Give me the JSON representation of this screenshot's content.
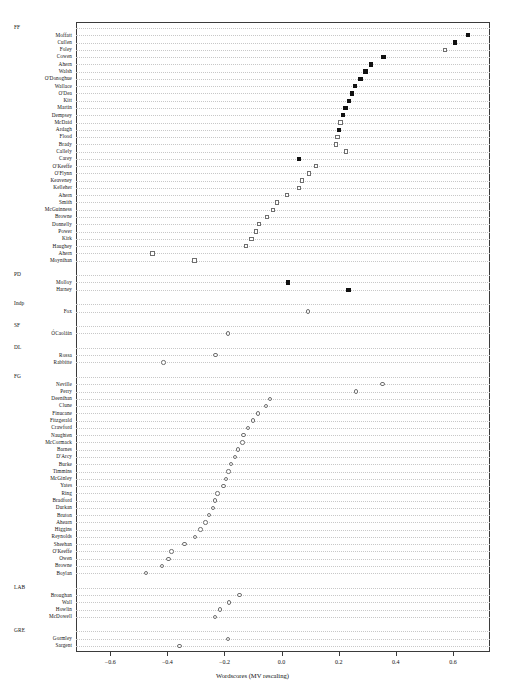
{
  "chart_data": {
    "type": "scatter",
    "title": "",
    "xlabel": "Wordscores (MV rescaling)",
    "ylabel": "",
    "xlim": [
      -0.72,
      0.73
    ],
    "grid": true,
    "legend": "none",
    "xticks": [
      -0.6,
      -0.4,
      -0.2,
      0.0,
      0.2,
      0.4,
      0.6
    ],
    "xticklabels": [
      "-0.6",
      "-0.4",
      "-0.2",
      "0.0",
      "0.2",
      "0.4",
      "0.6"
    ],
    "groups": [
      {
        "name": "FF",
        "marker": "square",
        "points": [
          {
            "label": "Moffatt",
            "value": 0.654,
            "fill": "filled"
          },
          {
            "label": "Cullen",
            "value": 0.608,
            "fill": "filled"
          },
          {
            "label": "Foley",
            "value": 0.573,
            "fill": "open"
          },
          {
            "label": "Cowen",
            "value": 0.357,
            "fill": "filled"
          },
          {
            "label": "Ahern",
            "value": 0.313,
            "fill": "filled"
          },
          {
            "label": "Walsh",
            "value": 0.294,
            "fill": "filled"
          },
          {
            "label": "O'Donoghue",
            "value": 0.276,
            "fill": "filled"
          },
          {
            "label": "Wallace",
            "value": 0.258,
            "fill": "filled"
          },
          {
            "label": "O'Dea",
            "value": 0.247,
            "fill": "filled"
          },
          {
            "label": "Kitt",
            "value": 0.236,
            "fill": "filled"
          },
          {
            "label": "Martin",
            "value": 0.224,
            "fill": "filled"
          },
          {
            "label": "Dempsey",
            "value": 0.215,
            "fill": "filled"
          },
          {
            "label": "McDaid",
            "value": 0.207,
            "fill": "open"
          },
          {
            "label": "Ardagh",
            "value": 0.201,
            "fill": "filled"
          },
          {
            "label": "Flood",
            "value": 0.196,
            "fill": "open"
          },
          {
            "label": "Brady",
            "value": 0.191,
            "fill": "open"
          },
          {
            "label": "Callely",
            "value": 0.225,
            "fill": "open"
          },
          {
            "label": "Carey",
            "value": 0.06,
            "fill": "filled"
          },
          {
            "label": "O'Keeffe",
            "value": 0.121,
            "fill": "open"
          },
          {
            "label": "O'Flynn",
            "value": 0.097,
            "fill": "open"
          },
          {
            "label": "Keaveney",
            "value": 0.072,
            "fill": "open"
          },
          {
            "label": "Kelleher",
            "value": 0.062,
            "fill": "open"
          },
          {
            "label": "Ahern",
            "value": 0.018,
            "fill": "open"
          },
          {
            "label": "Smith",
            "value": -0.015,
            "fill": "open"
          },
          {
            "label": "McGuinness",
            "value": -0.031,
            "fill": "open"
          },
          {
            "label": "Browne",
            "value": -0.052,
            "fill": "open"
          },
          {
            "label": "Donnelly",
            "value": -0.08,
            "fill": "open"
          },
          {
            "label": "Power",
            "value": -0.089,
            "fill": "open"
          },
          {
            "label": "Kirk",
            "value": -0.105,
            "fill": "open"
          },
          {
            "label": "Haughey",
            "value": -0.125,
            "fill": "open"
          },
          {
            "label": "Ahern",
            "value": -0.452,
            "fill": "open"
          },
          {
            "label": "Moynihan",
            "value": -0.305,
            "fill": "open"
          }
        ]
      },
      {
        "name": "PD",
        "marker": "square",
        "points": [
          {
            "label": "Molloy",
            "value": 0.022,
            "fill": "filled"
          },
          {
            "label": "Harney",
            "value": 0.235,
            "fill": "filled"
          }
        ]
      },
      {
        "name": "Indp",
        "marker": "circle",
        "points": [
          {
            "label": "Fox",
            "value": 0.092,
            "fill": "open"
          }
        ]
      },
      {
        "name": "SF",
        "marker": "circle",
        "points": [
          {
            "label": "ÓCaoláin",
            "value": -0.188,
            "fill": "open"
          }
        ]
      },
      {
        "name": "DL",
        "marker": "circle",
        "points": [
          {
            "label": "Rossa",
            "value": -0.232,
            "fill": "open"
          },
          {
            "label": "Rabbitte",
            "value": -0.413,
            "fill": "open"
          }
        ]
      },
      {
        "name": "FG",
        "marker": "circle",
        "points": [
          {
            "label": "Neville",
            "value": 0.354,
            "fill": "open"
          },
          {
            "label": "Perry",
            "value": 0.26,
            "fill": "open"
          },
          {
            "label": "Deenihan",
            "value": -0.04,
            "fill": "open"
          },
          {
            "label": "Clune",
            "value": -0.055,
            "fill": "open"
          },
          {
            "label": "Finucane",
            "value": -0.082,
            "fill": "open"
          },
          {
            "label": "Fitzgerald",
            "value": -0.1,
            "fill": "open"
          },
          {
            "label": "Crawford",
            "value": -0.117,
            "fill": "open"
          },
          {
            "label": "Naughten",
            "value": -0.133,
            "fill": "open"
          },
          {
            "label": "McCormack",
            "value": -0.137,
            "fill": "open"
          },
          {
            "label": "Barnes",
            "value": -0.153,
            "fill": "open"
          },
          {
            "label": "D'Arcy",
            "value": -0.163,
            "fill": "open"
          },
          {
            "label": "Burke",
            "value": -0.178,
            "fill": "open"
          },
          {
            "label": "Timmins",
            "value": -0.186,
            "fill": "open"
          },
          {
            "label": "McGinley",
            "value": -0.194,
            "fill": "open"
          },
          {
            "label": "Yates",
            "value": -0.204,
            "fill": "open"
          },
          {
            "label": "Ring",
            "value": -0.224,
            "fill": "open"
          },
          {
            "label": "Bradford",
            "value": -0.234,
            "fill": "open"
          },
          {
            "label": "Durkan",
            "value": -0.241,
            "fill": "open"
          },
          {
            "label": "Bruton",
            "value": -0.255,
            "fill": "open"
          },
          {
            "label": "Ahearn",
            "value": -0.267,
            "fill": "open"
          },
          {
            "label": "Higgins",
            "value": -0.284,
            "fill": "open"
          },
          {
            "label": "Reynolds",
            "value": -0.304,
            "fill": "open"
          },
          {
            "label": "Sheehan",
            "value": -0.34,
            "fill": "open"
          },
          {
            "label": "O'Keeffe",
            "value": -0.386,
            "fill": "open"
          },
          {
            "label": "Owen",
            "value": -0.396,
            "fill": "open"
          },
          {
            "label": "Browne",
            "value": -0.418,
            "fill": "open"
          },
          {
            "label": "Boylan",
            "value": -0.474,
            "fill": "open"
          }
        ]
      },
      {
        "name": "LAB",
        "marker": "circle",
        "points": [
          {
            "label": "Broughan",
            "value": -0.148,
            "fill": "open"
          },
          {
            "label": "Wall",
            "value": -0.184,
            "fill": "open"
          },
          {
            "label": "Howlin",
            "value": -0.216,
            "fill": "open"
          },
          {
            "label": "McDowell",
            "value": -0.233,
            "fill": "open"
          }
        ]
      },
      {
        "name": "GRE",
        "marker": "circle",
        "points": [
          {
            "label": "Gormley",
            "value": -0.187,
            "fill": "open"
          },
          {
            "label": "Sargent",
            "value": -0.358,
            "fill": "open"
          }
        ]
      }
    ]
  }
}
